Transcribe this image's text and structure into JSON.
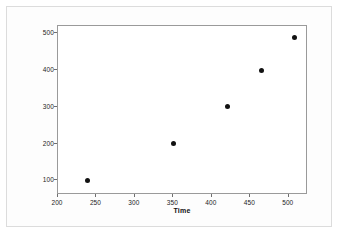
{
  "chart_data": {
    "type": "scatter",
    "title": "",
    "xlabel": "Time",
    "ylabel": "Number of Books",
    "xlim": [
      200,
      525
    ],
    "ylim": [
      60,
      520
    ],
    "grid": false,
    "legend": "none",
    "marker": "filled-circle",
    "marker_color": "#121212",
    "x": [
      238,
      350,
      420,
      465,
      507
    ],
    "y": [
      100,
      200,
      300,
      400,
      490
    ],
    "points": [
      {
        "x": 238,
        "y": 100
      },
      {
        "x": 350,
        "y": 200
      },
      {
        "x": 420,
        "y": 300
      },
      {
        "x": 465,
        "y": 400
      },
      {
        "x": 507,
        "y": 490
      }
    ],
    "xticks": [
      200,
      250,
      300,
      350,
      400,
      450,
      500
    ],
    "yticks": [
      100,
      200,
      300,
      400,
      500
    ],
    "xtick_labels": [
      "200",
      "250",
      "300",
      "350",
      "400",
      "450",
      "500"
    ],
    "ytick_labels": [
      "100",
      "200",
      "300",
      "400",
      "500"
    ]
  },
  "figure": {
    "frame_color": "#9a9a9a",
    "background_color": "#ffffff",
    "outer_border_color": "#dcdcdc"
  }
}
